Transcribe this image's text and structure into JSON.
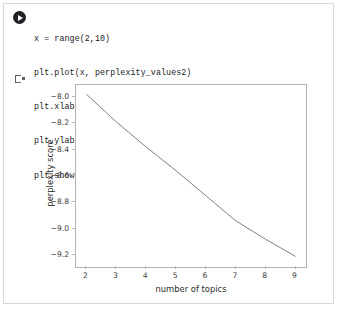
{
  "cell": {
    "run_button_label": "Run cell",
    "output_marker_label": "Output"
  },
  "code": {
    "lines": [
      "x = range(2,10)",
      "plt.plot(x, perplexity_values2)",
      "plt.xlabel('number of topics')",
      "plt.ylabel('perplexity score')",
      "plt.show()"
    ]
  },
  "chart_data": {
    "type": "line",
    "title": "",
    "xlabel": "number of topics",
    "ylabel": "perplexity score",
    "x": [
      2,
      3,
      4,
      5,
      6,
      7,
      8,
      9
    ],
    "values": [
      -7.98,
      -8.19,
      -8.38,
      -8.56,
      -8.75,
      -8.94,
      -9.08,
      -9.21
    ],
    "series": [
      {
        "name": "perplexity_values2",
        "values": [
          -7.98,
          -8.19,
          -8.38,
          -8.56,
          -8.75,
          -8.94,
          -9.08,
          -9.21
        ]
      }
    ],
    "xticks": [
      "2",
      "3",
      "4",
      "5",
      "6",
      "7",
      "8",
      "9"
    ],
    "yticks": [
      "−8.0",
      "−8.2",
      "−8.4",
      "−8.6",
      "−8.8",
      "−9.0",
      "−9.2"
    ],
    "ytick_values": [
      -8.0,
      -8.2,
      -8.4,
      -8.6,
      -8.8,
      -9.0,
      -9.2
    ],
    "xlim": [
      1.65,
      9.35
    ],
    "ylim": [
      -9.29,
      -7.91
    ],
    "grid": false,
    "legend": false,
    "line_color": "#7f7f7f"
  }
}
